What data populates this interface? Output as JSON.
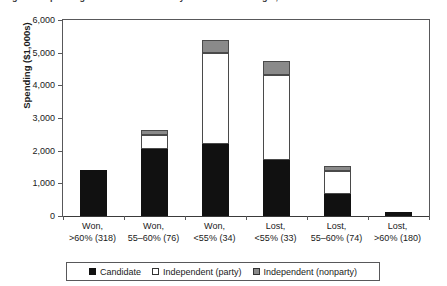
{
  "figure": {
    "clipped_title": "Figure 1. Spending in U.S. House races by outcome and margin, 2004"
  },
  "chart_data": {
    "type": "bar",
    "subtype": "stacked-vertical",
    "title": "",
    "xlabel": "",
    "ylabel": "Spending ($1,000s)",
    "ylim": [
      0,
      6000
    ],
    "ytick_step": 1000,
    "ytick_labels": [
      "6,000",
      "5,000",
      "4,000",
      "3,000",
      "2,000",
      "1,000",
      "0"
    ],
    "ytick_values": [
      6000,
      5000,
      4000,
      3000,
      2000,
      1000,
      0
    ],
    "grid": false,
    "legend_position": "bottom",
    "categories": [
      "Won, >60% (318)",
      "Won, 55–60% (76)",
      "Won, <55% (34)",
      "Lost, <55% (33)",
      "Lost, 55–60% (74)",
      "Lost, >60% (180)"
    ],
    "category_lines": [
      {
        "line1": "Won,",
        "line2": ">60% (318)"
      },
      {
        "line1": "Won,",
        "line2": "55–60% (76)"
      },
      {
        "line1": "Won,",
        "line2": "<55% (34)"
      },
      {
        "line1": "Lost,",
        "line2": "<55% (33)"
      },
      {
        "line1": "Lost,",
        "line2": "55–60% (74)"
      },
      {
        "line1": "Lost,",
        "line2": ">60% (180)"
      }
    ],
    "series": [
      {
        "name": "Candidate",
        "color": "#111111",
        "values": [
          1400,
          2050,
          2200,
          1710,
          670,
          120
        ]
      },
      {
        "name": "Independent (party)",
        "color": "#ffffff",
        "values": [
          0,
          430,
          2780,
          2600,
          710,
          0
        ]
      },
      {
        "name": "Independent (nonparty)",
        "color": "#8a8a8a",
        "values": [
          0,
          140,
          400,
          430,
          150,
          0
        ]
      }
    ],
    "totals": [
      1400,
      2620,
      5380,
      4740,
      1530,
      120
    ],
    "legend": [
      {
        "label": "Candidate",
        "swatch": "cand"
      },
      {
        "label": "Independent (party)",
        "swatch": "party"
      },
      {
        "label": "Independent (nonparty)",
        "swatch": "nonparty"
      }
    ]
  }
}
